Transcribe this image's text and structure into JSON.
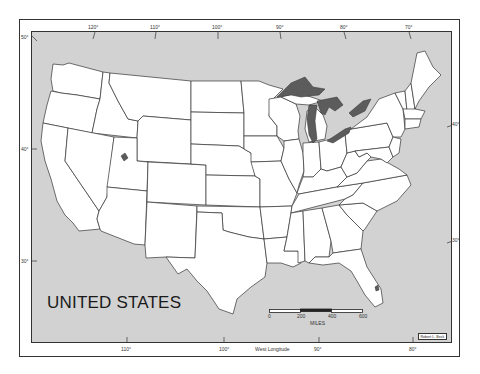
{
  "map": {
    "title": "UNITED STATES",
    "credit": "Robert L. Beck",
    "colors": {
      "ocean": "#d2d2d2",
      "land": "#ffffff",
      "lakes": "#5c5c5c",
      "borders": "#333333"
    },
    "top_longitude_labels": [
      "120°",
      "110°",
      "100°",
      "90°",
      "80°",
      "70°"
    ],
    "bottom_longitude_labels": [
      "110°",
      "100°",
      "90°",
      "80°"
    ],
    "bottom_axis_title": "West Longitude",
    "left_latitude_labels": [
      "50°",
      "40°",
      "30°"
    ],
    "right_latitude_labels": [
      "40°",
      "30°"
    ],
    "scale": {
      "ticks": [
        "0",
        "200",
        "400",
        "600"
      ],
      "unit": "MILES"
    }
  }
}
